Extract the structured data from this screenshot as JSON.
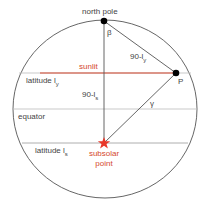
{
  "diagram": {
    "labels": {
      "north_pole": "north pole",
      "beta": "β",
      "p_arc": "90-l",
      "p_arc_sub": "y",
      "sunlit": "sunlit",
      "latitude_y": "latitude l",
      "latitude_y_sub": "y",
      "point_p": "P",
      "s_arc": "90-l",
      "s_arc_sub": "s",
      "gamma": "γ",
      "equator": "equator",
      "latitude_s": "latitude l",
      "latitude_s_sub": "s",
      "subsolar_line1": "subsolar",
      "subsolar_line2": "point"
    },
    "colors": {
      "line": "#555555",
      "latitude_line": "#bbbbbb",
      "sunlit": "#d4472e",
      "star": "#e8372a",
      "dot": "#000000"
    }
  }
}
